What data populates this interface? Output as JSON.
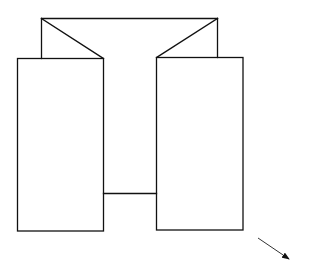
{
  "diagram": {
    "type": "line-drawing",
    "stroke_color": "#111111",
    "background_color": "#ffffff",
    "shapes": {
      "back_panel_top": {
        "x1": 41.5,
        "y1": 18.5,
        "x2": 217.5,
        "y2": 18.5
      },
      "back_panel_left_edge": {
        "x1": 41.5,
        "y1": 18.5,
        "x2": 41.5,
        "y2": 58.5
      },
      "back_panel_right_edge": {
        "x1": 217.5,
        "y1": 18.5,
        "x2": 217.5,
        "y2": 57.5
      },
      "left_diagonal": {
        "x1": 41.5,
        "y1": 18.5,
        "x2": 103.5,
        "y2": 58.5
      },
      "right_diagonal": {
        "x1": 217.5,
        "y1": 18.5,
        "x2": 156.5,
        "y2": 57.5
      },
      "left_panel": {
        "x": 17.5,
        "y": 58.5,
        "width": 86,
        "height": 172.5
      },
      "right_panel": {
        "x": 156.5,
        "y": 57.5,
        "width": 86.5,
        "height": 172.5
      },
      "center_bottom": {
        "x1": 103.5,
        "y1": 193.5,
        "x2": 156.5,
        "y2": 193.5
      },
      "arrow": {
        "x1": 258,
        "y1": 238,
        "x2": 289,
        "y2": 259
      }
    }
  }
}
